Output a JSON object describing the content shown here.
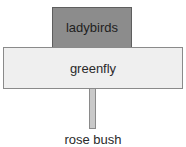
{
  "diagram": {
    "type": "pyramid-of-numbers",
    "levels": [
      {
        "label": "ladybirds",
        "trophic_level": 3,
        "fill": "#8c8c8c"
      },
      {
        "label": "greenfly",
        "trophic_level": 2,
        "fill": "#efefef"
      },
      {
        "label": "rose bush",
        "trophic_level": 1,
        "fill": "#c9c9c9"
      }
    ]
  }
}
